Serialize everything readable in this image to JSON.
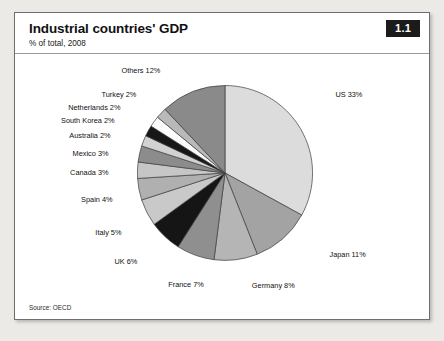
{
  "header": {
    "title": "Industrial countries' GDP",
    "subtitle": "% of total, 2008",
    "badge": "1.1"
  },
  "footer": {
    "source": "Source: OECD"
  },
  "chart_data": {
    "type": "pie",
    "title": "Industrial countries' GDP",
    "subtitle": "% of total, 2008",
    "unit": "% of total",
    "year": 2008,
    "start_angle_deg": 0,
    "direction": "clockwise",
    "legend": "none",
    "labels_position": "outside",
    "categories": [
      "US",
      "Japan",
      "Germany",
      "France",
      "UK",
      "Italy",
      "Spain",
      "Canada",
      "Mexico",
      "Australia",
      "South Korea",
      "Netherlands",
      "Turkey",
      "Others"
    ],
    "values": [
      33,
      11,
      8,
      7,
      6,
      5,
      4,
      3,
      3,
      2,
      2,
      2,
      2,
      12
    ],
    "slices": [
      {
        "name": "US",
        "value": 33,
        "label": "US 33%",
        "color": "#dcdcdc",
        "label_x": 336,
        "label_y": 97,
        "anchor": "start"
      },
      {
        "name": "Japan",
        "value": 11,
        "label": "Japan 11%",
        "color": "#a3a3a3",
        "label_x": 330,
        "label_y": 258,
        "anchor": "start"
      },
      {
        "name": "Germany",
        "value": 8,
        "label": "Germany 8%",
        "color": "#b5b5b5",
        "label_x": 252,
        "label_y": 289,
        "anchor": "start"
      },
      {
        "name": "France",
        "value": 7,
        "label": "France 7%",
        "color": "#8f8f8f",
        "label_x": 168,
        "label_y": 288,
        "anchor": "start"
      },
      {
        "name": "UK",
        "value": 6,
        "label": "UK 6%",
        "color": "#151515",
        "label_x": 137,
        "label_y": 265,
        "anchor": "end"
      },
      {
        "name": "Italy",
        "value": 5,
        "label": "Italy 5%",
        "color": "#c9c9c9",
        "label_x": 121,
        "label_y": 235,
        "anchor": "end"
      },
      {
        "name": "Spain",
        "value": 4,
        "label": "Spain 4%",
        "color": "#b0b0b0",
        "label_x": 112,
        "label_y": 202,
        "anchor": "end"
      },
      {
        "name": "Canada",
        "value": 3,
        "label": "Canada 3%",
        "color": "#c6c6c6",
        "label_x": 108,
        "label_y": 175,
        "anchor": "end"
      },
      {
        "name": "Mexico",
        "value": 3,
        "label": "Mexico 3%",
        "color": "#8c8c8c",
        "label_x": 108,
        "label_y": 156,
        "anchor": "end"
      },
      {
        "name": "Australia",
        "value": 2,
        "label": "Australia 2%",
        "color": "#d2d2d2",
        "label_x": 110,
        "label_y": 138,
        "anchor": "end"
      },
      {
        "name": "South Korea",
        "value": 2,
        "label": "South Korea 2%",
        "color": "#171717",
        "label_x": 114,
        "label_y": 123,
        "anchor": "end"
      },
      {
        "name": "Netherlands",
        "value": 2,
        "label": "Netherlands 2%",
        "color": "#fbfbfb",
        "label_x": 120,
        "label_y": 110,
        "anchor": "end"
      },
      {
        "name": "Turkey",
        "value": 2,
        "label": "Turkey 2%",
        "color": "#b9b9b9",
        "label_x": 136,
        "label_y": 97,
        "anchor": "end"
      },
      {
        "name": "Others",
        "value": 12,
        "label": "Others 12%",
        "color": "#8a8a8a",
        "label_x": 160,
        "label_y": 72,
        "anchor": "end"
      }
    ],
    "geometry": {
      "cx": 225,
      "cy": 173,
      "r": 88
    }
  }
}
